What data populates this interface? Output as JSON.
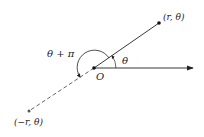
{
  "diagram": {
    "labels": {
      "point_positive": "(r, θ)",
      "point_negative": "(−r, θ)",
      "origin": "O",
      "angle_theta": "θ",
      "angle_theta_pi": "θ + π"
    },
    "colors": {
      "line": "#222222",
      "dashed": "#555555",
      "background": "#ffffff"
    }
  }
}
